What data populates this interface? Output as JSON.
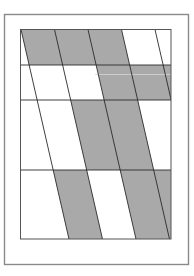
{
  "canvas": {
    "width": 194,
    "height": 276,
    "background": "#ffffff"
  },
  "outer_frame": {
    "x": 4.5,
    "y": 14.5,
    "width": 184,
    "height": 250,
    "stroke": "#8a8a8a",
    "stroke_width": 1.4
  },
  "inner_frame": {
    "x": 20.5,
    "y": 29.5,
    "width": 150.5,
    "height": 209.5,
    "stroke": "#555555",
    "stroke_width": 1
  },
  "colors": {
    "shade": "#a9a9a9",
    "line": "#2a2a2a",
    "highlight": "#d6d6d6"
  },
  "rows": [
    {
      "name": "row-1",
      "y_top": 29.5,
      "y_bottom": 65
    },
    {
      "name": "row-2",
      "y_top": 65,
      "y_bottom": 100
    },
    {
      "name": "row-3",
      "y_top": 100,
      "y_bottom": 170
    },
    {
      "name": "row-4",
      "y_top": 170,
      "y_bottom": 239
    }
  ],
  "diagonals": {
    "slope_dx_per_dy": 0.229,
    "top_y": 29.5,
    "top_x": [
      21,
      54.5,
      88,
      121.5,
      155
    ]
  },
  "shaded_bands": [
    {
      "row": 0,
      "from_line": 0,
      "to_line": 3
    },
    {
      "row": 1,
      "from_line": 2,
      "to_line": 5
    },
    {
      "row": 2,
      "from_line": 1,
      "to_line": 3
    },
    {
      "row": 3,
      "from_line": 0,
      "to_line": 1
    },
    {
      "row": 3,
      "from_line": 2,
      "to_line": 5
    }
  ],
  "artifacts": [
    {
      "y": 74.5,
      "x1": 95,
      "x2": 171
    }
  ]
}
